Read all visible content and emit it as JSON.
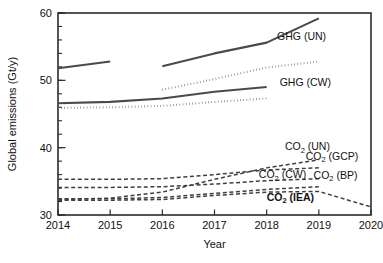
{
  "chart_data": {
    "type": "line",
    "title": "",
    "xlabel": "Year",
    "ylabel": "Global emissions (Gt/y)",
    "xlim": [
      2014,
      2020
    ],
    "ylim": [
      30,
      60
    ],
    "xticks": [
      "2014",
      "2015",
      "2016",
      "2017",
      "2018",
      "2019",
      "2020"
    ],
    "yticks": [
      "30",
      "40",
      "50",
      "60"
    ],
    "yminor_step": 2,
    "grid": false,
    "legend_position": "inline-right-of-lines",
    "series": [
      {
        "name": "GHG (UN)",
        "style": "solid",
        "label": "GHG (UN)",
        "segments": [
          {
            "x": [
              2014,
              2015
            ],
            "y": [
              51.8,
              52.8
            ]
          },
          {
            "x": [
              2016,
              2017,
              2018,
              2019
            ],
            "y": [
              52.1,
              54.0,
              55.6,
              59.2
            ]
          }
        ]
      },
      {
        "name": "GHG (GCP-dotted-upper)",
        "style": "dotted",
        "label": "",
        "segments": [
          {
            "x": [
              2016,
              2017,
              2018,
              2019
            ],
            "y": [
              48.6,
              50.2,
              51.9,
              52.8
            ]
          }
        ]
      },
      {
        "name": "GHG (CW)",
        "style": "solid",
        "label": "GHG (CW)",
        "segments": [
          {
            "x": [
              2014,
              2015,
              2016,
              2017,
              2018
            ],
            "y": [
              46.6,
              46.8,
              47.3,
              48.3,
              49.0
            ]
          }
        ]
      },
      {
        "name": "GHG (dotted-lower)",
        "style": "dotted",
        "label": "",
        "segments": [
          {
            "x": [
              2014,
              2015,
              2016,
              2017,
              2018
            ],
            "y": [
              45.9,
              46.0,
              46.2,
              46.8,
              47.3
            ]
          }
        ]
      },
      {
        "name": "CO2 (UN)",
        "style": "dashed",
        "label": "CO₂ (UN)",
        "segments": [
          {
            "x": [
              2014,
              2015,
              2016,
              2017,
              2018,
              2019
            ],
            "y": [
              32.3,
              32.5,
              33.4,
              35.3,
              37.0,
              38.2
            ]
          }
        ]
      },
      {
        "name": "CO2 (GCP)",
        "style": "dashed",
        "label": "CO₂ (GCP)",
        "segments": [
          {
            "x": [
              2014,
              2015,
              2016,
              2017,
              2018,
              2019
            ],
            "y": [
              35.3,
              35.3,
              35.4,
              36.0,
              36.7,
              37.0
            ]
          }
        ]
      },
      {
        "name": "CO2 (CW)",
        "style": "dashed",
        "label": "CO₂ (CW)",
        "segments": [
          {
            "x": [
              2014,
              2015,
              2016,
              2017,
              2018,
              2019
            ],
            "y": [
              34.1,
              34.1,
              34.2,
              34.6,
              35.1,
              35.4
            ]
          }
        ]
      },
      {
        "name": "CO2 (BP)",
        "style": "dashed",
        "label": "CO₂ (BP)",
        "segments": [
          {
            "x": [
              2014,
              2015,
              2016,
              2017,
              2018,
              2019
            ],
            "y": [
              32.4,
              32.4,
              32.6,
              33.2,
              33.8,
              34.2
            ]
          }
        ]
      },
      {
        "name": "CO2 (IEA)",
        "style": "dashed",
        "label": "CO₂ (IEA)",
        "segments": [
          {
            "x": [
              2014,
              2015,
              2016,
              2017,
              2018,
              2019,
              2020
            ],
            "y": [
              32.2,
              32.2,
              32.3,
              32.9,
              33.4,
              33.5,
              31.2
            ]
          }
        ]
      }
    ],
    "annotations": [
      {
        "text": "GHG (UN)",
        "x": 2018.2,
        "y": 56.0,
        "bold": false
      },
      {
        "text": "GHG (CW)",
        "x": 2018.25,
        "y": 49.1,
        "bold": false
      },
      {
        "text": "CO₂ (UN)",
        "x": 2018.35,
        "y": 39.6,
        "bold": false
      },
      {
        "text": "CO₂ (GCP)",
        "x": 2018.75,
        "y": 38.2,
        "bold": false
      },
      {
        "text": "CO₂ (CW)",
        "x": 2017.85,
        "y": 35.5,
        "bold": false
      },
      {
        "text": "CO₂ (BP)",
        "x": 2018.9,
        "y": 35.4,
        "bold": false
      },
      {
        "text": "CO₂ (IEA)",
        "x": 2018.0,
        "y": 32.1,
        "bold": true
      }
    ]
  }
}
